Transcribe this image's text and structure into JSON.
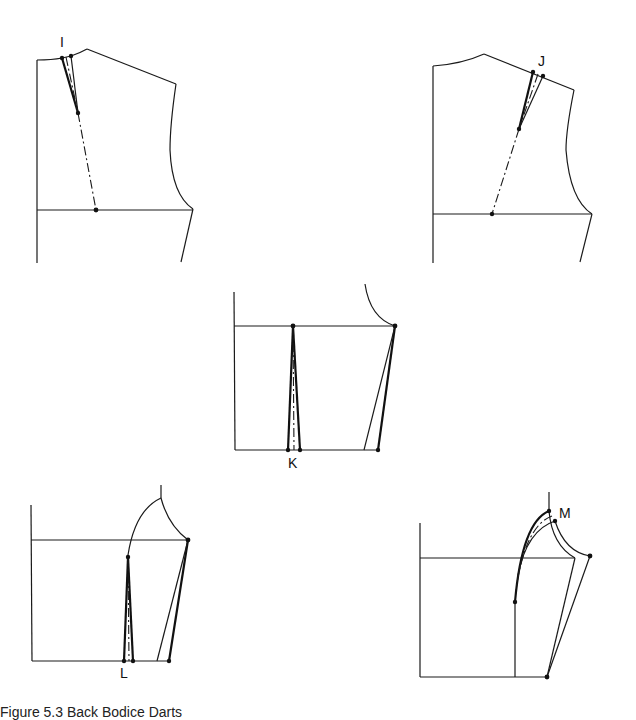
{
  "figure": {
    "line_color": "#111111",
    "background": "#ffffff",
    "panels": [
      {
        "id": "panel-I",
        "label": "I",
        "position": "top-left",
        "content": "Front bodice with shoulder dart at neck, dash-dot guideline to chest line"
      },
      {
        "id": "panel-J",
        "label": "J",
        "position": "top-right",
        "content": "Front bodice with shoulder dart moved toward shoulder"
      },
      {
        "id": "panel-K",
        "label": "K",
        "position": "center",
        "content": "Lower bodice with waist dart and side seam adjustment"
      },
      {
        "id": "panel-L",
        "label": "L",
        "position": "bottom-left",
        "content": "Lower bodice with waist dart rising into armhole curve"
      },
      {
        "id": "panel-M",
        "label": "M",
        "position": "bottom-right",
        "content": "Dart transferred to armhole curve"
      }
    ],
    "caption": "Figure 5.3 Back Bodice Darts"
  }
}
